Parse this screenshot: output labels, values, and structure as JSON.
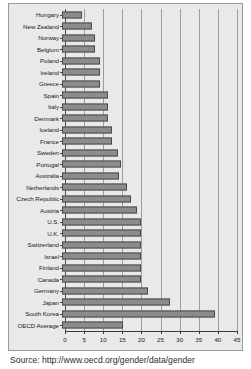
{
  "source_note": "Source: http://www.oecd.org/gender/data/gender",
  "chart_data": {
    "type": "bar",
    "orientation": "horizontal",
    "title": "",
    "subtitle": "",
    "xlabel": "",
    "ylabel": "",
    "xlim": [
      0,
      45
    ],
    "ylim": null,
    "grid": true,
    "legend": false,
    "legend_position": "none",
    "xticks": [
      0,
      5,
      10,
      15,
      20,
      25,
      30,
      35,
      40,
      45
    ],
    "xtick_labels": [
      "0",
      "5",
      "10",
      "15",
      "20",
      "25",
      "30",
      "35",
      "40",
      "45"
    ],
    "bar_color": "#8c8c8c",
    "bar_edge_color": "#4a4a4a",
    "plot_background": "#e9e9e9",
    "grid_color": "#9d9d9d",
    "categories": [
      "Hungary",
      "New Zealand",
      "Norway",
      "Belgium",
      "Poland",
      "Ireland",
      "Greece",
      "Spain",
      "Italy",
      "Denmark",
      "Iceland",
      "France",
      "Sweden",
      "Portugal",
      "Australia",
      "Netherlands",
      "Czech Republic",
      "Austria",
      "U.S.",
      "U.K.",
      "Switzerland",
      "Israel",
      "Finland",
      "Canada",
      "Germany",
      "Japan",
      "South Korea",
      "OECD Average"
    ],
    "values": [
      5.0,
      7.5,
      8.3,
      8.3,
      9.6,
      9.6,
      9.6,
      11.6,
      11.6,
      11.6,
      12.6,
      12.6,
      14.2,
      15.1,
      14.4,
      16.5,
      17.5,
      19.1,
      20.0,
      20.0,
      20.0,
      20.0,
      20.0,
      20.0,
      21.8,
      27.5,
      39.0,
      15.5
    ]
  }
}
